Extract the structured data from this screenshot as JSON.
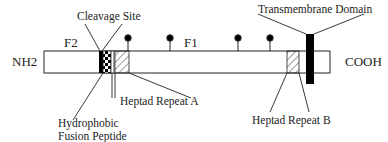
{
  "diagram": {
    "terminals": {
      "n_term": "NH2",
      "c_term": "COOH"
    },
    "subunits": {
      "f2": "F2",
      "f1": "F1"
    },
    "labels": {
      "cleavage_site": "Cleavage Site",
      "transmembrane_domain": "Transmembrane Domain",
      "fusion_peptide_line1": "Hydrophobic",
      "fusion_peptide_line2": "Fusion Peptide",
      "heptad_repeat_a": "Heptad Repeat A",
      "heptad_repeat_b": "Heptad Repeat B"
    },
    "glycosylation_sites": [
      128,
      170,
      238,
      270
    ],
    "colors": {
      "stroke": "#222222",
      "fill": "#ffffff",
      "tm": "#000000"
    }
  }
}
